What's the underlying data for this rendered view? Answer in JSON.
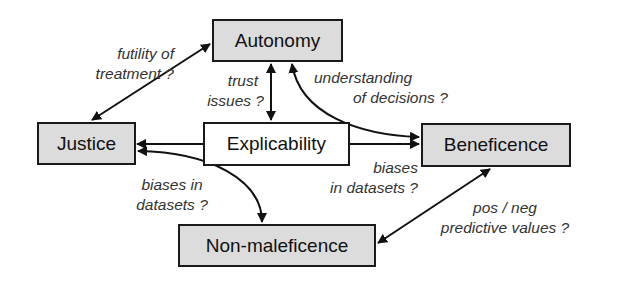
{
  "nodes": {
    "autonomy": "Autonomy",
    "justice": "Justice",
    "explicability": "Explicability",
    "beneficence": "Beneficence",
    "non_maleficence": "Non-maleficence"
  },
  "edges": {
    "justice_autonomy": [
      "futility of",
      "treatment ?"
    ],
    "explicability_autonomy": [
      "trust",
      "issues ?"
    ],
    "autonomy_beneficence": [
      "understanding",
      "of decisions ?"
    ],
    "explicability_beneficence": [
      "biases",
      "in datasets ?"
    ],
    "justice_non_maleficence": [
      "biases in",
      "datasets ?"
    ],
    "beneficence_non_maleficence": [
      "pos / neg",
      "predictive values ?"
    ]
  },
  "colors": {
    "principle_fill": "#dcdcdc",
    "explicability_fill": "#ffffff",
    "stroke": "#1a1a1a"
  }
}
